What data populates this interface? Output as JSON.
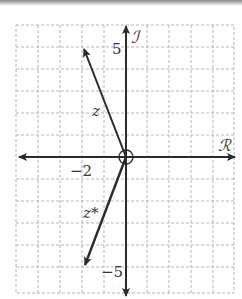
{
  "diagram": {
    "axes": {
      "real_label": "ℛ",
      "imag_label": "ℐ",
      "tick_labels": {
        "y_top": "5",
        "y_bottom": "−5",
        "x_left": "−2"
      }
    },
    "vectors": [
      {
        "name": "z",
        "label": "z",
        "x": -2,
        "y": 5
      },
      {
        "name": "z_conjugate",
        "label": "z*",
        "x": -2,
        "y": -5
      }
    ],
    "origin_marker": "circle",
    "grid": {
      "spacing_units": 1,
      "x_range": [
        -5,
        5
      ],
      "y_range": [
        -6,
        6
      ]
    },
    "colors": {
      "axis": "#2a2a2a",
      "grid": "#b5b5b5",
      "vector": "#2a2a2a"
    }
  }
}
